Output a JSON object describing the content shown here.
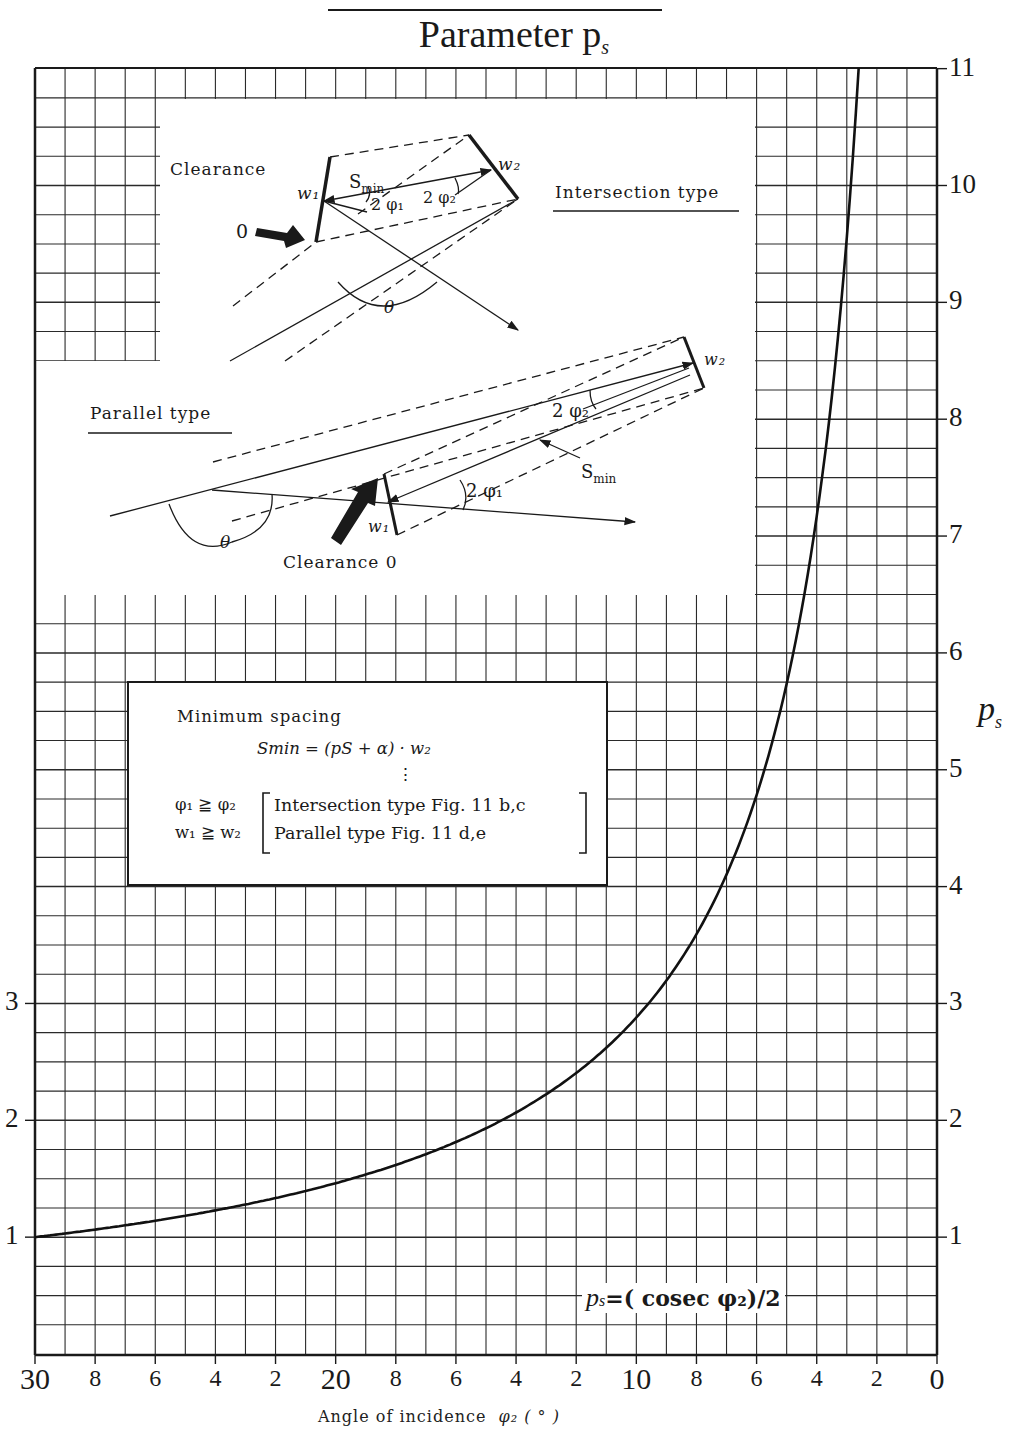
{
  "page": {
    "title": "Parameter p",
    "title_subscript": "s",
    "top_rule_visible": true
  },
  "chart_data": {
    "type": "line",
    "xlabel": "Angle of incidence φ2 (°)",
    "ylabel": "p_s",
    "xlim": [
      30,
      0
    ],
    "ylim": [
      0,
      11
    ],
    "x_axis_reversed": true,
    "grid": true,
    "grid_minor_x": 1,
    "grid_minor_y": 0.25,
    "x_tick_labels": [
      "30",
      "8",
      "6",
      "4",
      "2",
      "20",
      "8",
      "6",
      "4",
      "2",
      "10",
      "8",
      "6",
      "4",
      "2",
      "0"
    ],
    "x_tick_values": [
      30,
      28,
      26,
      24,
      22,
      20,
      18,
      16,
      14,
      12,
      10,
      8,
      6,
      4,
      2,
      0
    ],
    "y_tick_labels_right": [
      "1",
      "2",
      "3",
      "4",
      "5",
      "6",
      "7",
      "8",
      "9",
      "10",
      "11"
    ],
    "y_tick_labels_left": [
      "1",
      "2",
      "3"
    ],
    "series": [
      {
        "name": "p_s = (cosec φ2)/2",
        "x": [
          30,
          28,
          26,
          24,
          22,
          20,
          18,
          16,
          14,
          12,
          10,
          9,
          8,
          7,
          6,
          5,
          4.5,
          4,
          3.5,
          3.0,
          2.6
        ],
        "y": [
          1.0,
          1.07,
          1.14,
          1.23,
          1.33,
          1.46,
          1.62,
          1.81,
          2.07,
          2.4,
          2.88,
          3.2,
          3.59,
          4.1,
          4.78,
          5.74,
          6.37,
          7.17,
          8.19,
          9.55,
          11.02
        ]
      }
    ],
    "annotations": [
      "p_s=(cosec φ2)/2"
    ]
  },
  "axes": {
    "right_ticks": [
      {
        "label": "1",
        "value": 1
      },
      {
        "label": "2",
        "value": 2
      },
      {
        "label": "3",
        "value": 3
      },
      {
        "label": "4",
        "value": 4
      },
      {
        "label": "5",
        "value": 5
      },
      {
        "label": "6",
        "value": 6
      },
      {
        "label": "7",
        "value": 7
      },
      {
        "label": "8",
        "value": 8
      },
      {
        "label": "9",
        "value": 9
      },
      {
        "label": "10",
        "value": 10
      },
      {
        "label": "11",
        "value": 11
      }
    ],
    "left_ticks": [
      {
        "label": "1",
        "value": 1
      },
      {
        "label": "2",
        "value": 2
      },
      {
        "label": "3",
        "value": 3
      }
    ],
    "bottom_ticks": [
      {
        "label": "30",
        "value": 30,
        "major": true
      },
      {
        "label": "8",
        "value": 28
      },
      {
        "label": "6",
        "value": 26
      },
      {
        "label": "4",
        "value": 24
      },
      {
        "label": "2",
        "value": 22
      },
      {
        "label": "20",
        "value": 20,
        "major": true
      },
      {
        "label": "8",
        "value": 18
      },
      {
        "label": "6",
        "value": 16
      },
      {
        "label": "4",
        "value": 14
      },
      {
        "label": "2",
        "value": 12
      },
      {
        "label": "10",
        "value": 10,
        "major": true
      },
      {
        "label": "8",
        "value": 8
      },
      {
        "label": "6",
        "value": 6
      },
      {
        "label": "4",
        "value": 4
      },
      {
        "label": "2",
        "value": 2
      },
      {
        "label": "0",
        "value": 0,
        "major": true
      }
    ],
    "x_title": "Angle of incidence",
    "x_title_symbol": "φ₂ ( ° )",
    "y_title": "p",
    "y_title_sub": "s"
  },
  "curve_label": {
    "lhs": "p",
    "lhs_sub": "s",
    "rhs": "=( cosec φ₂)/2"
  },
  "diagram": {
    "intersection": {
      "heading": "Intersection type",
      "clearance_label": "Clearance",
      "zero_label": "0",
      "w1": "w₁",
      "w2": "w₂",
      "smin": "S",
      "smin_sub": "min",
      "angle1": "2 φ₁",
      "angle2": "2 φ₂",
      "theta": "θ"
    },
    "parallel": {
      "heading": "Parallel type",
      "clearance_label": "Clearance 0",
      "w1": "w₁",
      "w2": "w₂",
      "smin": "S",
      "smin_sub": "min",
      "angle1": "2 φ₁",
      "angle2": "2 φ₂",
      "theta": "θ"
    }
  },
  "formula_box": {
    "heading": "Minimum spacing",
    "equation": "Smin = (pS + α) · w₂",
    "ellipsis": "⋮",
    "cond1_lhs": "φ₁ ≧ φ₂",
    "cond1_rhs": "Intersection type Fig. 11 b,c",
    "cond2_lhs": "w₁ ≧ w₂",
    "cond2_rhs": "Parallel type Fig. 11 d,e"
  }
}
